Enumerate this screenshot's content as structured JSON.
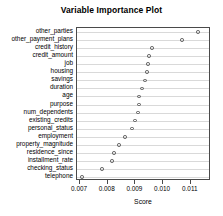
{
  "chart_data": {
    "type": "scatter",
    "title": "Variable Importance Plot",
    "xlabel": "Score",
    "ylabel": "",
    "xlim": [
      0.00689,
      0.01173
    ],
    "grid": true,
    "grid_orientation": "horizontal",
    "legend": null,
    "orientation": "horizontal-dotplot",
    "marker": "open-circle",
    "xticks": [
      0.007,
      0.008,
      0.009,
      0.01,
      0.011
    ],
    "xticklabels": [
      "0.007",
      "0.008",
      "0.009",
      "0.010",
      "0.011"
    ],
    "categories": [
      "other_parties",
      "other_payment_plans",
      "credit_history",
      "credit_amount",
      "job",
      "housing",
      "savings",
      "duration",
      "age",
      "purpose",
      "num_dependents",
      "existing_credits",
      "personal_status",
      "employment",
      "property_magnitude",
      "residence_since",
      "installment_rate",
      "checking_status",
      "telephone"
    ],
    "values": [
      0.01125,
      0.01068,
      0.0096,
      0.00949,
      0.00945,
      0.00941,
      0.00934,
      0.00923,
      0.00912,
      0.00912,
      0.00909,
      0.00898,
      0.00887,
      0.00862,
      0.0084,
      0.00822,
      0.00815,
      0.00779,
      0.00708
    ]
  },
  "axes": {
    "xaxis_title": "Score"
  }
}
